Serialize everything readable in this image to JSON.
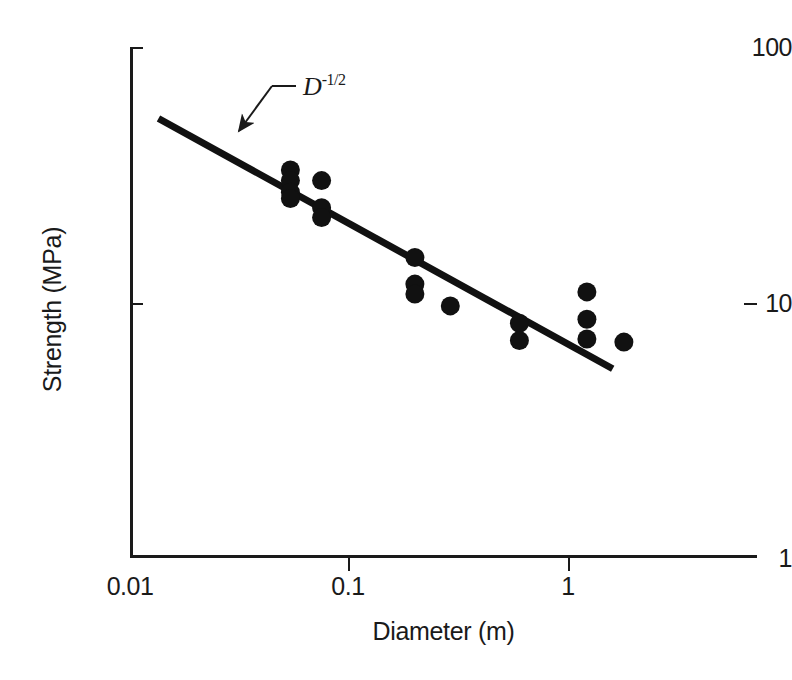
{
  "figure": {
    "background": "#ffffff",
    "ink_color": "#1a1a1a"
  },
  "annotation": {
    "base": "D",
    "exponent": "-1/2",
    "full_text": "D^-1/2"
  },
  "chart_data": {
    "type": "scatter",
    "title": "",
    "xlabel": "Diameter (m)",
    "ylabel": "Strength (MPa)",
    "xscale": "log",
    "yscale": "log",
    "xlim": [
      0.01,
      5.5
    ],
    "ylim": [
      1,
      100
    ],
    "grid": false,
    "legend": null,
    "xticks": [
      0.01,
      0.1,
      1
    ],
    "xticklabels": [
      "0.01",
      "0.1",
      "1"
    ],
    "yticks": [
      1,
      10,
      100
    ],
    "yticklabels": [
      "1",
      "10",
      "100"
    ],
    "marker": "filled-circle",
    "marker_color": "#111111",
    "points": [
      {
        "x": 0.054,
        "y": 33.0
      },
      {
        "x": 0.054,
        "y": 30.0
      },
      {
        "x": 0.054,
        "y": 27.0
      },
      {
        "x": 0.054,
        "y": 25.5
      },
      {
        "x": 0.075,
        "y": 30.0
      },
      {
        "x": 0.075,
        "y": 23.5
      },
      {
        "x": 0.075,
        "y": 21.5
      },
      {
        "x": 0.2,
        "y": 15.0
      },
      {
        "x": 0.2,
        "y": 11.8
      },
      {
        "x": 0.2,
        "y": 10.8
      },
      {
        "x": 0.29,
        "y": 9.7
      },
      {
        "x": 0.6,
        "y": 8.3
      },
      {
        "x": 0.6,
        "y": 7.1
      },
      {
        "x": 1.22,
        "y": 11.0
      },
      {
        "x": 1.22,
        "y": 8.6
      },
      {
        "x": 1.22,
        "y": 7.2
      },
      {
        "x": 1.8,
        "y": 7.0
      }
    ],
    "trendline": {
      "label": "D^-1/2",
      "slope": -0.5,
      "x_start": 0.0135,
      "y_start": 52.5,
      "x_end": 1.6,
      "y_end": 5.5,
      "color": "#111111",
      "linewidth": 7
    },
    "annotations": [
      {
        "text": "D^-1/2",
        "x_text": 0.027,
        "y_text": 61.0,
        "arrow_to_x": 0.0215,
        "arrow_to_y": 42.0
      }
    ]
  }
}
